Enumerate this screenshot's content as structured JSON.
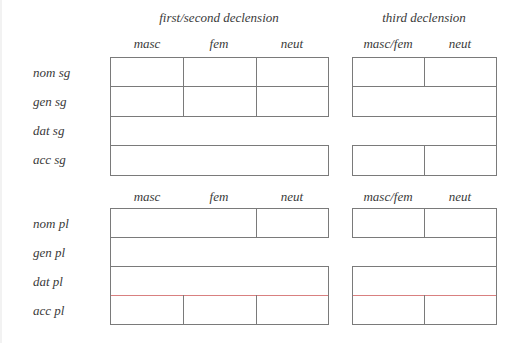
{
  "headings": {
    "first_second": "first/second declension",
    "third": "third declension"
  },
  "column_headers": {
    "first_second": [
      "masc",
      "fem",
      "neut"
    ],
    "third": [
      "masc/fem",
      "neut"
    ]
  },
  "singular": {
    "rows": [
      "nom sg",
      "gen sg",
      "dat sg",
      "acc sg"
    ]
  },
  "plural": {
    "rows": [
      "nom pl",
      "gen pl",
      "dat pl",
      "acc pl"
    ]
  },
  "colors": {
    "border": "#7a7a7a",
    "highlight_line": "#d98080"
  }
}
